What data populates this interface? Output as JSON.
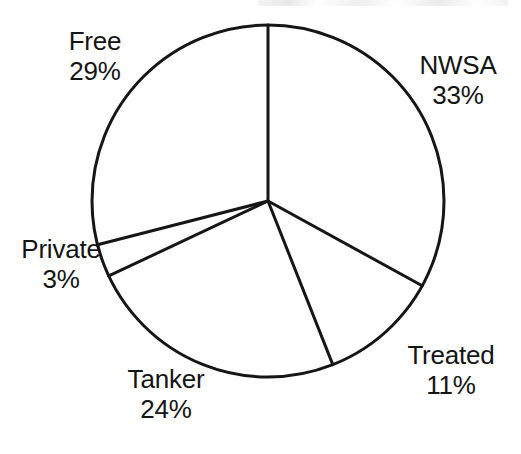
{
  "figure": {
    "background_color": "#ffffff",
    "stroke_color": "#161616",
    "text_color": "#141414",
    "top_artifact_label": "scan-artifact"
  },
  "chart_data": {
    "type": "pie",
    "title": "",
    "subtitle": "",
    "xlabel": "",
    "ylabel": "",
    "legend_position": "none",
    "grid": false,
    "labels_outside": true,
    "start_angle_deg": 0,
    "direction": "clockwise",
    "center": {
      "x": 268,
      "y": 201
    },
    "radius": 176,
    "categories": [
      "NWSA",
      "Treated",
      "Tanker",
      "Private",
      "Free"
    ],
    "values": [
      33,
      11,
      24,
      3,
      29
    ],
    "unit": "%",
    "slices": [
      {
        "name": "NWSA",
        "value": 33,
        "percent_text": "33%",
        "start_deg": 0.0,
        "end_deg": 118.8
      },
      {
        "name": "Treated",
        "value": 11,
        "percent_text": "11%",
        "start_deg": 118.8,
        "end_deg": 158.4
      },
      {
        "name": "Tanker",
        "value": 24,
        "percent_text": "24%",
        "start_deg": 158.4,
        "end_deg": 244.8
      },
      {
        "name": "Private",
        "value": 3,
        "percent_text": "3%",
        "start_deg": 244.8,
        "end_deg": 255.6
      },
      {
        "name": "Free",
        "value": 29,
        "percent_text": "29%",
        "start_deg": 255.6,
        "end_deg": 360.0
      }
    ]
  },
  "labels": {
    "free": {
      "name": "Free",
      "percent": "29%"
    },
    "nwsa": {
      "name": "NWSA",
      "percent": "33%"
    },
    "private": {
      "name": "Private",
      "percent": "3%"
    },
    "treated": {
      "name": "Treated",
      "percent": "11%"
    },
    "tanker": {
      "name": "Tanker",
      "percent": "24%"
    }
  }
}
